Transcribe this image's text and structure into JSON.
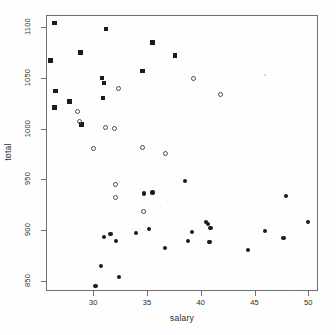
{
  "chart_data": {
    "type": "scatter",
    "title": "",
    "subtitle": "",
    "xlabel": "salary",
    "ylabel": "total",
    "xlim": [
      25.6,
      50.9
    ],
    "ylim": [
      840,
      1112
    ],
    "xticks": [
      30,
      35,
      40,
      45,
      50
    ],
    "xticklabels": [
      "30",
      "35",
      "40",
      "45",
      "50"
    ],
    "yticks": [
      850,
      900,
      950,
      1000,
      1050,
      1100
    ],
    "yticklabels": [
      "850",
      "900",
      "950",
      "1000",
      "1050",
      "1100"
    ],
    "grid": false,
    "legend": "none",
    "frame": true,
    "series": [
      {
        "name": "group-filled-square",
        "marker": "filled-square",
        "color": "#1b1b1b",
        "points": [
          {
            "x": 26.4,
            "y": 1104
          },
          {
            "x": 26.0,
            "y": 1067
          },
          {
            "x": 26.5,
            "y": 1037
          },
          {
            "x": 26.4,
            "y": 1021
          },
          {
            "x": 27.8,
            "y": 1027
          },
          {
            "x": 28.8,
            "y": 1075
          },
          {
            "x": 28.9,
            "y": 1004
          },
          {
            "x": 30.8,
            "y": 1050
          },
          {
            "x": 31.0,
            "y": 1045
          },
          {
            "x": 30.9,
            "y": 1030
          },
          {
            "x": 31.2,
            "y": 1098
          },
          {
            "x": 34.6,
            "y": 1057
          },
          {
            "x": 35.5,
            "y": 1085
          },
          {
            "x": 37.6,
            "y": 1072
          }
        ]
      },
      {
        "name": "group-open-circle",
        "marker": "open-circle",
        "color": "#4a4a4a",
        "points": [
          {
            "x": 28.5,
            "y": 1017
          },
          {
            "x": 28.7,
            "y": 1007
          },
          {
            "x": 30.0,
            "y": 980
          },
          {
            "x": 31.1,
            "y": 1001
          },
          {
            "x": 32.0,
            "y": 1000
          },
          {
            "x": 32.3,
            "y": 1040
          },
          {
            "x": 32.1,
            "y": 945
          },
          {
            "x": 32.1,
            "y": 932
          },
          {
            "x": 34.6,
            "y": 981
          },
          {
            "x": 34.7,
            "y": 918
          },
          {
            "x": 36.7,
            "y": 976
          },
          {
            "x": 39.3,
            "y": 1049
          },
          {
            "x": 41.8,
            "y": 1034
          }
        ]
      },
      {
        "name": "group-filled-circle",
        "marker": "filled-circle",
        "color": "#1b1b1b",
        "points": [
          {
            "x": 30.2,
            "y": 845
          },
          {
            "x": 30.7,
            "y": 865
          },
          {
            "x": 31.0,
            "y": 893
          },
          {
            "x": 31.6,
            "y": 896
          },
          {
            "x": 32.1,
            "y": 889
          },
          {
            "x": 32.4,
            "y": 854
          },
          {
            "x": 34.0,
            "y": 897
          },
          {
            "x": 34.7,
            "y": 936
          },
          {
            "x": 35.2,
            "y": 901
          },
          {
            "x": 35.5,
            "y": 937
          },
          {
            "x": 36.7,
            "y": 882
          },
          {
            "x": 38.5,
            "y": 948
          },
          {
            "x": 38.8,
            "y": 889
          },
          {
            "x": 39.2,
            "y": 898
          },
          {
            "x": 40.5,
            "y": 908
          },
          {
            "x": 40.7,
            "y": 906
          },
          {
            "x": 40.9,
            "y": 902
          },
          {
            "x": 40.8,
            "y": 888
          },
          {
            "x": 44.4,
            "y": 880
          },
          {
            "x": 46.0,
            "y": 899
          },
          {
            "x": 47.7,
            "y": 892
          },
          {
            "x": 47.9,
            "y": 934
          },
          {
            "x": 50.0,
            "y": 908
          }
        ]
      }
    ]
  }
}
